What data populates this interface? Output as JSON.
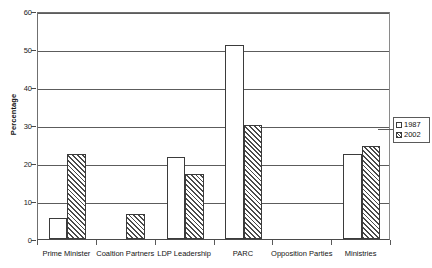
{
  "chart_data": {
    "type": "bar",
    "title": "",
    "xlabel": "",
    "ylabel": "Percentage",
    "ylim": [
      0,
      60
    ],
    "ytick_step": 10,
    "yticks": [
      0,
      10,
      20,
      30,
      40,
      50,
      60
    ],
    "ytick_labels": [
      "0",
      "10",
      "20",
      "30",
      "40",
      "50",
      "60"
    ],
    "grid": true,
    "grid_axis": "y",
    "legend_position": "right",
    "categories": [
      "Prime Minister",
      "Coaltion Partners",
      "LDP Leadership",
      "PARC",
      "Opposition Parties",
      "Ministries"
    ],
    "series": [
      {
        "name": "1987",
        "fill": "solid-white",
        "color": "#ffffff",
        "edge_color": "#3b3b3b",
        "values": [
          5.5,
          0,
          21.5,
          51,
          0,
          22.5
        ]
      },
      {
        "name": "2002",
        "fill": "diagonal-hatch",
        "color": "#4a4a4a",
        "edge_color": "#3b3b3b",
        "values": [
          22.5,
          6.5,
          17,
          30,
          0,
          24.5
        ]
      }
    ]
  },
  "legend": {
    "entries": [
      {
        "label": "1987",
        "swatch": "empty-box-swatch"
      },
      {
        "label": "2002",
        "swatch": "hatched-box-swatch"
      }
    ]
  },
  "axes": {
    "y_title": "Percentage"
  }
}
